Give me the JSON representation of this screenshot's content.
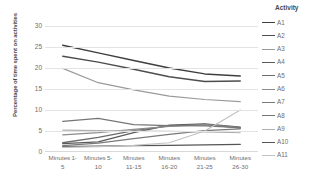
{
  "chart_data": {
    "type": "line",
    "title": "",
    "xlabel": "",
    "ylabel": "Percentage of time spent on activities",
    "legend_title": "Activity",
    "legend_position": "right",
    "grid": true,
    "ylim": [
      0,
      30
    ],
    "yticks": [
      30,
      25,
      20,
      15,
      10,
      5,
      0
    ],
    "categories": [
      "Minutes 1-5",
      "Minutes 5-10",
      "Minutes 11-15",
      "Minutes 16-20",
      "Minutes 21-25",
      "Minutes 26-30"
    ],
    "category_lines": [
      [
        "Minutes 1-",
        "5"
      ],
      [
        "Minutes 5-",
        "10"
      ],
      [
        "Minutes",
        "11-15"
      ],
      [
        "Minutes",
        "16-20"
      ],
      [
        "Minutes",
        "21-25"
      ],
      [
        "Minutes",
        "26-30"
      ]
    ],
    "series": [
      {
        "name": "A1",
        "color": "#3f3f3f",
        "width": 1.5,
        "values": [
          25.4,
          23.6,
          21.8,
          20.0,
          18.6,
          18.1
        ]
      },
      {
        "name": "A2",
        "color": "#4d4d4d",
        "width": 1.5,
        "values": [
          22.8,
          21.4,
          19.7,
          17.9,
          16.8,
          16.9
        ]
      },
      {
        "name": "A3",
        "color": "#9a9a9a",
        "width": 1.2,
        "values": [
          19.9,
          16.5,
          14.8,
          13.3,
          12.5,
          12.0
        ]
      },
      {
        "name": "A4",
        "color": "#5a5a5a",
        "width": 1.3,
        "values": [
          2.0,
          2.4,
          4.6,
          6.4,
          6.7,
          5.9
        ]
      },
      {
        "name": "A5",
        "color": "#6b6b6b",
        "width": 1.3,
        "values": [
          2.2,
          3.5,
          5.1,
          6.2,
          6.6,
          5.7
        ]
      },
      {
        "name": "A6",
        "color": "#8c8c8c",
        "width": 1.2,
        "values": [
          4.1,
          4.6,
          5.4,
          6.1,
          6.5,
          5.8
        ]
      },
      {
        "name": "A7",
        "color": "#7a7a7a",
        "width": 1.2,
        "values": [
          1.5,
          2.1,
          3.2,
          4.2,
          5.1,
          5.5
        ]
      },
      {
        "name": "A8",
        "color": "#767676",
        "width": 1.3,
        "values": [
          7.3,
          8.0,
          6.5,
          6.3,
          6.2,
          5.8
        ]
      },
      {
        "name": "A9",
        "color": "#b0b0b0",
        "width": 1.1,
        "values": [
          5.2,
          5.1,
          5.0,
          4.9,
          4.8,
          4.6
        ]
      },
      {
        "name": "A10",
        "color": "#555555",
        "width": 1.3,
        "values": [
          1.3,
          1.4,
          1.5,
          1.6,
          1.7,
          1.8
        ]
      },
      {
        "name": "A11",
        "color": "#c2c2c2",
        "width": 1.2,
        "values": [
          1.1,
          1.3,
          1.6,
          2.2,
          5.0,
          10.0
        ]
      }
    ]
  }
}
